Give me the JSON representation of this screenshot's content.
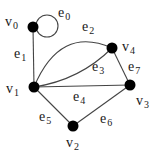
{
  "diagram": {
    "type": "graph",
    "vertices": [
      {
        "id": "v0",
        "name": "v",
        "index": "0",
        "x": 33,
        "y": 27,
        "label_x": 5,
        "label_y": 15
      },
      {
        "id": "v1",
        "name": "v",
        "index": "1",
        "x": 34,
        "y": 87,
        "label_x": 6,
        "label_y": 82
      },
      {
        "id": "v2",
        "name": "v",
        "index": "2",
        "x": 73,
        "y": 126,
        "label_x": 66,
        "label_y": 138
      },
      {
        "id": "v3",
        "name": "v",
        "index": "3",
        "x": 130,
        "y": 85,
        "label_x": 136,
        "label_y": 95
      },
      {
        "id": "v4",
        "name": "v",
        "index": "4",
        "x": 112,
        "y": 48,
        "label_x": 122,
        "label_y": 42
      }
    ],
    "edges": [
      {
        "id": "e0",
        "name": "e",
        "index": "0",
        "from": "v0",
        "to": "v0",
        "kind": "loop",
        "label_x": 58,
        "label_y": 6
      },
      {
        "id": "e1",
        "name": "e",
        "index": "1",
        "from": "v0",
        "to": "v1",
        "kind": "straight",
        "label_x": 14,
        "label_y": 47
      },
      {
        "id": "e2",
        "name": "e",
        "index": "2",
        "from": "v1",
        "to": "v4",
        "kind": "arc-high",
        "label_x": 82,
        "label_y": 20
      },
      {
        "id": "e3",
        "name": "e",
        "index": "3",
        "from": "v1",
        "to": "v4",
        "kind": "arc-low",
        "label_x": 92,
        "label_y": 61
      },
      {
        "id": "e4",
        "name": "e",
        "index": "4",
        "from": "v1",
        "to": "v3",
        "kind": "straight",
        "label_x": 73,
        "label_y": 92
      },
      {
        "id": "e5",
        "name": "e",
        "index": "5",
        "from": "v1",
        "to": "v2",
        "kind": "straight",
        "label_x": 39,
        "label_y": 110
      },
      {
        "id": "e6",
        "name": "e",
        "index": "6",
        "from": "v2",
        "to": "v3",
        "kind": "straight",
        "label_x": 100,
        "label_y": 112
      },
      {
        "id": "e7",
        "name": "e",
        "index": "7",
        "from": "v4",
        "to": "v3",
        "kind": "straight",
        "label_x": 128,
        "label_y": 60
      }
    ],
    "colors": {
      "node": "#000000",
      "edge": "#444444",
      "text": "#1a1a1a",
      "background": "#ffffff"
    }
  }
}
